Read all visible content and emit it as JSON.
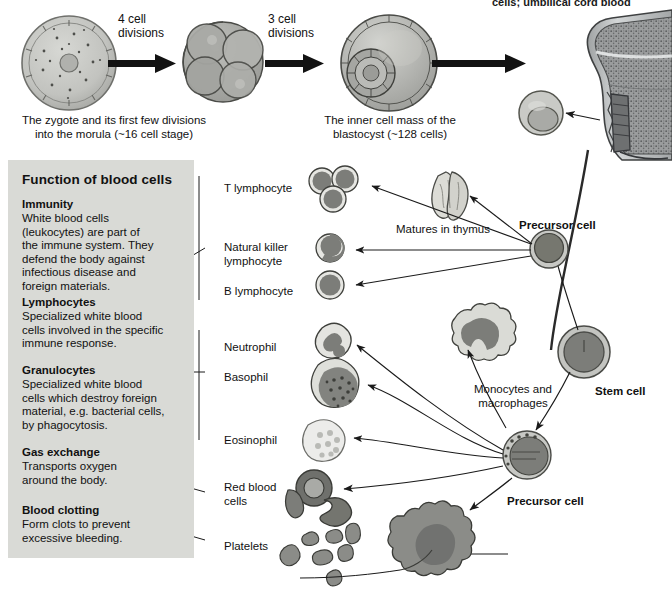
{
  "page": {
    "top_cut_text": "cells; umbilical cord blood",
    "bottom_cut_text": "",
    "bg": "#ffffff"
  },
  "development": {
    "steps": [
      {
        "label": "4 cell\ndivisions",
        "name": "four-cell-divisions"
      },
      {
        "label": "3 cell\ndivisions",
        "name": "three-cell-divisions"
      }
    ],
    "captions": [
      "The zygote and its first few divisions\ninto the morula (~16 cell stage)",
      "The inner cell mass of the\nblastocyst (~128 cells)"
    ]
  },
  "infobox": {
    "title": "Function of blood cells",
    "sections": [
      {
        "heading": "Immunity",
        "body": "White blood cells\n(leukocytes) are part of\nthe immune system. They\ndefend the body against\ninfectious disease and\nforeign materials."
      },
      {
        "heading": "Lymphocytes",
        "body": "Specialized white blood\ncells involved in the specific\nimmune response."
      },
      {
        "heading": "Granulocytes",
        "body": "Specialized white blood\ncells which destroy foreign\nmaterial, e.g. bacterial cells,\nby phagocytosis."
      },
      {
        "heading": "Gas exchange",
        "body": "Transports oxygen\naround the body."
      },
      {
        "heading": "Blood clotting",
        "body": "Form clots to prevent\nexcessive bleeding."
      }
    ],
    "background": "#d9dad6"
  },
  "cell_labels": {
    "t_lymphocyte": "T lymphocyte",
    "natural_killer": "Natural killer\nlymphocyte",
    "b_lymphocyte": "B lymphocyte",
    "neutrophil": "Neutrophil",
    "basophil": "Basophil",
    "eosinophil": "Eosinophil",
    "red_blood_cells": "Red blood\ncells",
    "platelets": "Platelets"
  },
  "annotations": {
    "matures_in_thymus": "Matures in thymus",
    "precursor_cell_upper": "Precursor cell",
    "precursor_cell_lower": "Precursor cell",
    "stem_cell": "Stem cell",
    "monocytes_macrophages": "Monocytes and\nmacrophages"
  },
  "colors": {
    "cell_outline": "#3a3a3a",
    "cytoplasm_light": "#cfcfcb",
    "nucleus_dark": "#7b7b78",
    "nucleus_darker": "#6a6a67",
    "bone_shaft": "#b9bcbd",
    "marrow": "#8e9091",
    "arrow_black": "#121212",
    "panel": "#d9dad6"
  }
}
